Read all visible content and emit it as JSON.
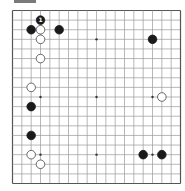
{
  "diagram": {
    "type": "go-board",
    "size": 19,
    "colors": {
      "line": "#9a9a9a",
      "border": "#555555",
      "black": "#1a1a1a",
      "white": "#ffffff",
      "star": "#333333"
    },
    "star_points": [
      [
        3,
        3
      ],
      [
        9,
        3
      ],
      [
        15,
        3
      ],
      [
        3,
        9
      ],
      [
        9,
        9
      ],
      [
        15,
        9
      ],
      [
        3,
        15
      ],
      [
        9,
        15
      ],
      [
        15,
        15
      ]
    ],
    "stones": [
      {
        "col": 3,
        "row": 1,
        "color": "black",
        "label": "1"
      },
      {
        "col": 2,
        "row": 2,
        "color": "black",
        "label": ""
      },
      {
        "col": 3,
        "row": 2,
        "color": "white",
        "label": ""
      },
      {
        "col": 5,
        "row": 2,
        "color": "black",
        "label": ""
      },
      {
        "col": 3,
        "row": 3,
        "color": "white",
        "label": ""
      },
      {
        "col": 15,
        "row": 3,
        "color": "black",
        "label": ""
      },
      {
        "col": 3,
        "row": 5,
        "color": "white",
        "label": ""
      },
      {
        "col": 2,
        "row": 8,
        "color": "white",
        "label": ""
      },
      {
        "col": 16,
        "row": 9,
        "color": "white",
        "label": ""
      },
      {
        "col": 2,
        "row": 10,
        "color": "black",
        "label": ""
      },
      {
        "col": 2,
        "row": 13,
        "color": "black",
        "label": ""
      },
      {
        "col": 2,
        "row": 15,
        "color": "white",
        "label": ""
      },
      {
        "col": 14,
        "row": 15,
        "color": "black",
        "label": ""
      },
      {
        "col": 16,
        "row": 15,
        "color": "black",
        "label": ""
      },
      {
        "col": 3,
        "row": 16,
        "color": "white",
        "label": ""
      }
    ]
  }
}
